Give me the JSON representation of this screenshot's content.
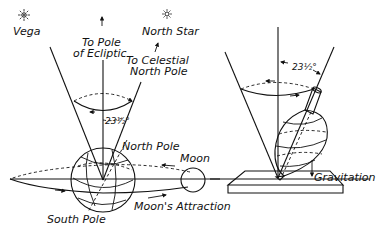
{
  "diagram": {
    "left": {
      "stars": {
        "vega": "Vega",
        "north_star": "North Star"
      },
      "labels": {
        "pole_ecliptic_line1": "To Pole",
        "pole_ecliptic_line2": "of Ecliptic",
        "celestial_pole_line1": "To Celestial",
        "celestial_pole_line2": "North Pole",
        "angle": "23½°",
        "north_pole": "North Pole",
        "south_pole": "South Pole",
        "moon": "Moon",
        "moons_attraction": "Moon's Attraction"
      }
    },
    "right": {
      "labels": {
        "angle": "23½°",
        "gravitation": "Gravitation"
      }
    },
    "colors": {
      "ink": "#111111",
      "background": "#ffffff"
    }
  }
}
